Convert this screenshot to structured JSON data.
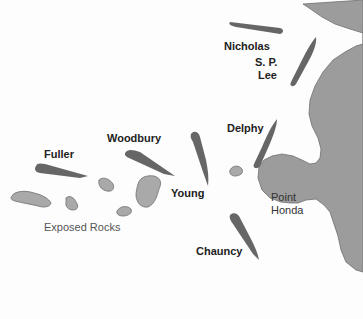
{
  "map": {
    "colors": {
      "land": "#9a9a9a",
      "rocks": "#a8a8a8",
      "ship": "#666666",
      "outline": "#6e6e6e",
      "water": "#fdfdfd"
    },
    "ships": [
      {
        "name": "Nicholas"
      },
      {
        "name": "S. P. Lee",
        "line1": "S. P.",
        "line2": "Lee"
      },
      {
        "name": "Delphy"
      },
      {
        "name": "Woodbury"
      },
      {
        "name": "Fuller"
      },
      {
        "name": "Young"
      },
      {
        "name": "Chauncy"
      }
    ],
    "places": {
      "point_honda_line1": "Point",
      "point_honda_line2": "Honda"
    },
    "rocks_label": "Exposed Rocks"
  }
}
